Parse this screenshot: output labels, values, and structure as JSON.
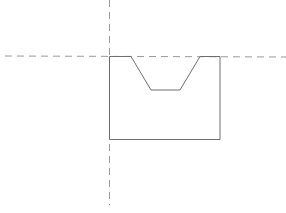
{
  "diagram": {
    "width": 286,
    "height": 213,
    "background": "#ffffff",
    "guide_color": "#9a9a9a",
    "outline_color": "#6e6e6e",
    "guides": {
      "horizontal": {
        "x1": 5,
        "y1": 56,
        "x2": 286,
        "y2": 57
      },
      "vertical": {
        "x1": 109.5,
        "y1": 0,
        "x2": 109.5,
        "y2": 205
      }
    },
    "outline": {
      "points": [
        [
          109.5,
          56.5
        ],
        [
          131,
          56.5
        ],
        [
          151,
          90
        ],
        [
          180,
          90
        ],
        [
          200,
          56.5
        ],
        [
          220,
          56.5
        ],
        [
          220,
          139.5
        ],
        [
          109.5,
          139.5
        ]
      ]
    }
  }
}
